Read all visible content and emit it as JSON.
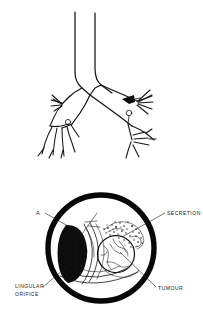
{
  "figure": {
    "background_color": "#ffffff",
    "ink_color": "#151515",
    "panels": [
      {
        "id": "bronchial-tree",
        "name": "Bronchial tree diagram",
        "description": "Line drawing of trachea, carina, main bronchi and segmental branches",
        "markers": [
          {
            "name": "tumour-arrow-marker",
            "shape": "filled-arrowhead",
            "color": "#0d0d0d",
            "position": "left main bronchus, distal"
          },
          {
            "name": "orifice-ring-marker",
            "shape": "small-open-circle",
            "color": "#151515",
            "position": "below arrow marker"
          }
        ]
      },
      {
        "id": "bronchoscopic-view",
        "name": "Bronchoscopic circular view",
        "description": "Circular endoscopic field showing lingular orifice, tumour mass and secretion",
        "rim_color": "#080808"
      }
    ]
  },
  "labels": {
    "a": "A",
    "secretion": "SECRETION",
    "lingular_orifice_line1": "LINGULAR",
    "lingular_orifice_line2": "ORIFICE",
    "tumour": "TUMOUR"
  },
  "annotations": [
    {
      "key": "a",
      "text": "A",
      "points_to": "anterior bronchial wall fold"
    },
    {
      "key": "secretion",
      "text": "SECRETION",
      "points_to": "stippled mucous secretion"
    },
    {
      "key": "lingular",
      "text": "LINGULAR ORIFICE",
      "points_to": "black crescent orifice"
    },
    {
      "key": "tumour",
      "text": "TUMOUR",
      "points_to": "round nodular mass"
    }
  ]
}
